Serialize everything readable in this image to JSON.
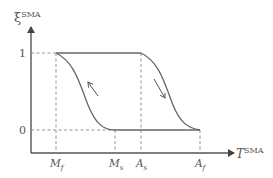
{
  "diagram": {
    "type": "hysteresis-curve",
    "y_axis": {
      "symbol": "ξ",
      "superscript": "SMA"
    },
    "x_axis": {
      "symbol": "T",
      "superscript": "SMA"
    },
    "y_ticks": [
      {
        "label": "1"
      },
      {
        "label": "0"
      }
    ],
    "x_ticks": [
      {
        "main": "M",
        "sub": "f"
      },
      {
        "main": "M",
        "sub": "s"
      },
      {
        "main": "A",
        "sub": "s"
      },
      {
        "main": "A",
        "sub": "f"
      }
    ],
    "curves": [
      {
        "name": "cooling",
        "from": "M_s at 0",
        "to": "M_f at 1",
        "arrow_direction": "up-left"
      },
      {
        "name": "heating",
        "from": "A_s at 1",
        "to": "A_f at 0",
        "arrow_direction": "down-right"
      }
    ],
    "colors": {
      "line": "#666666",
      "dashed": "#888888",
      "text": "#555555"
    }
  }
}
